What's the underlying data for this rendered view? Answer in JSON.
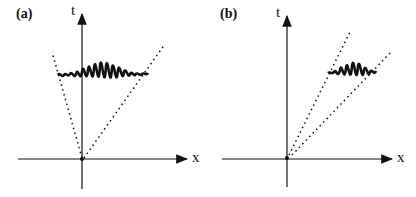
{
  "panels": [
    {
      "id": "a",
      "label": "(a)",
      "t_axis_label": "t",
      "x_axis_label": "x",
      "description": "Wave packet centered near t-axis, spreading within wide light-cone (dotted lines)"
    },
    {
      "id": "b",
      "label": "(b)",
      "t_axis_label": "t",
      "x_axis_label": "x",
      "description": "Wave packet moving in +x direction within narrow cone (dotted lines)"
    }
  ],
  "colors": {
    "ink": "#111111",
    "background": "#ffffff"
  }
}
